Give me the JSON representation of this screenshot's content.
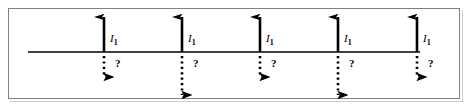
{
  "figure": {
    "name": "current-carrying-wires-diagram",
    "width": 469,
    "height": 109,
    "background_color": "#ffffff",
    "border_color": "#808080",
    "stroke_color": "#000000"
  },
  "axis": {
    "name": "horizontal-line",
    "x_start": 28,
    "x_end": 420,
    "y": 52
  },
  "elements": [
    {
      "id": 1,
      "x": 104,
      "up_arrow": {
        "top": 17,
        "bottom": 52,
        "style": "solid"
      },
      "current_label": "I",
      "current_subscript": "1",
      "current_label_x": 110,
      "current_label_y": 33,
      "down_arrow": {
        "top": 56,
        "bottom": 77,
        "style": "dotted",
        "length": "short"
      },
      "question_label": "?",
      "question_x": 115,
      "question_y": 58
    },
    {
      "id": 2,
      "x": 182,
      "up_arrow": {
        "top": 17,
        "bottom": 52,
        "style": "solid"
      },
      "current_label": "I",
      "current_subscript": "1",
      "current_label_x": 188,
      "current_label_y": 33,
      "down_arrow": {
        "top": 56,
        "bottom": 95,
        "style": "dotted",
        "length": "long"
      },
      "question_label": "?",
      "question_x": 193,
      "question_y": 58
    },
    {
      "id": 3,
      "x": 260,
      "up_arrow": {
        "top": 17,
        "bottom": 52,
        "style": "solid"
      },
      "current_label": "I",
      "current_subscript": "1",
      "current_label_x": 266,
      "current_label_y": 33,
      "down_arrow": {
        "top": 56,
        "bottom": 77,
        "style": "dotted",
        "length": "short"
      },
      "question_label": "?",
      "question_x": 271,
      "question_y": 58
    },
    {
      "id": 4,
      "x": 338,
      "up_arrow": {
        "top": 17,
        "bottom": 52,
        "style": "solid"
      },
      "current_label": "I",
      "current_subscript": "1",
      "current_label_x": 344,
      "current_label_y": 33,
      "down_arrow": {
        "top": 56,
        "bottom": 95,
        "style": "dotted",
        "length": "long"
      },
      "question_label": "?",
      "question_x": 349,
      "question_y": 58
    },
    {
      "id": 5,
      "x": 417,
      "up_arrow": {
        "top": 17,
        "bottom": 52,
        "style": "solid"
      },
      "current_label": "I",
      "current_subscript": "1",
      "current_label_x": 423,
      "current_label_y": 33,
      "down_arrow": {
        "top": 56,
        "bottom": 77,
        "style": "dotted",
        "length": "short"
      },
      "question_label": "?",
      "question_x": 428,
      "question_y": 58
    }
  ]
}
